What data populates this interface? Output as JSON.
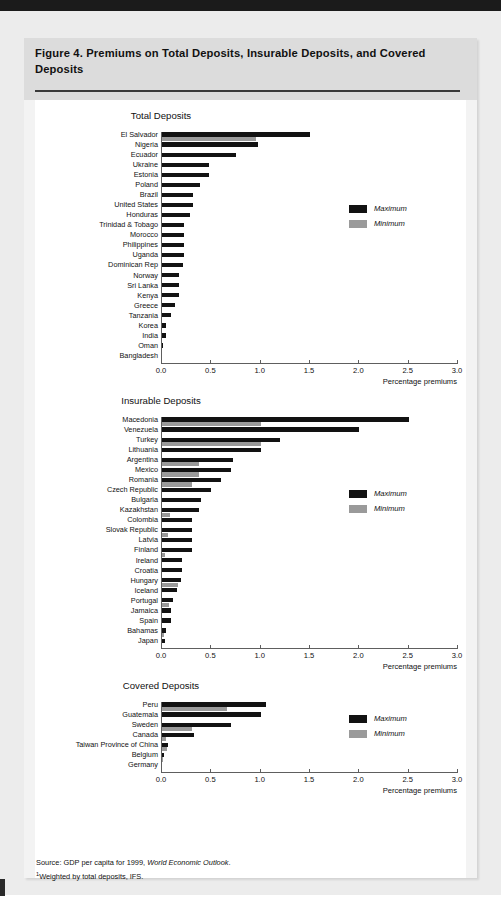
{
  "figure": {
    "title": "Figure 4.  Premiums on Total Deposits, Insurable Deposits, and Covered Deposits",
    "source_line1_prefix": "Source:  GDP per capita for 1999, ",
    "source_line1_italic": "World Economic Outlook",
    "source_line1_suffix": ".",
    "source_line2_marker": "1",
    "source_line2": "Weighted by total deposits, IFS."
  },
  "legend": {
    "maximum": "Maximum",
    "minimum": "Minimum"
  },
  "axis": {
    "xlabel": "Percentage premiums",
    "ticks": [
      "0.0",
      "0.5",
      "1.0",
      "1.5",
      "2.0",
      "2.5",
      "3.0"
    ]
  },
  "colors": {
    "maximum": "#121212",
    "minimum": "#9a9a9a",
    "panel": "#f3f3f3",
    "header": "#dcdcdc",
    "page": "#ececec",
    "axis": "#5e5e5e"
  },
  "chart_data": [
    {
      "type": "bar",
      "orientation": "horizontal",
      "title": "Total Deposits",
      "xlabel": "Percentage premiums",
      "ylabel": "",
      "xlim": [
        0.0,
        3.0
      ],
      "xticks": [
        0.0,
        0.5,
        1.0,
        1.5,
        2.0,
        2.5,
        3.0
      ],
      "grid": false,
      "legend_position": "right",
      "categories": [
        "El Salvador",
        "Nigeria",
        "Ecuador",
        "Ukraine",
        "Estonia",
        "Poland",
        "Brazil",
        "United States",
        "Honduras",
        "Trinidad & Tobago",
        "Morocco",
        "Philippines",
        "Uganda",
        "Dominican Rep",
        "Norway",
        "Sri Lanka",
        "Kenya",
        "Greece",
        "Tanzania",
        "Korea",
        "India",
        "Oman",
        "Bangladesh"
      ],
      "series": [
        {
          "name": "Maximum",
          "values": [
            1.5,
            0.97,
            0.75,
            0.48,
            0.48,
            0.39,
            0.31,
            0.31,
            0.28,
            0.22,
            0.22,
            0.22,
            0.22,
            0.21,
            0.17,
            0.17,
            0.17,
            0.13,
            0.09,
            0.04,
            0.04,
            0.01,
            0.0
          ]
        },
        {
          "name": "Minimum",
          "values": [
            0.95,
            0.0,
            0.0,
            0.0,
            0.0,
            0.0,
            0.0,
            0.0,
            0.0,
            0.0,
            0.0,
            0.0,
            0.0,
            0.0,
            0.0,
            0.0,
            0.0,
            0.0,
            0.0,
            0.0,
            0.0,
            0.0,
            0.0
          ]
        }
      ]
    },
    {
      "type": "bar",
      "orientation": "horizontal",
      "title": "Insurable Deposits",
      "xlabel": "Percentage premiums",
      "ylabel": "",
      "xlim": [
        0.0,
        3.0
      ],
      "xticks": [
        0.0,
        0.5,
        1.0,
        1.5,
        2.0,
        2.5,
        3.0
      ],
      "grid": false,
      "legend_position": "right",
      "categories": [
        "Macedonia",
        "Venezuela",
        "Turkey",
        "Lithuania",
        "Argentina",
        "Mexico",
        "Romania",
        "Czech Republic",
        "Bulgaria",
        "Kazakhstan",
        "Colombia",
        "Slovak Republic",
        "Latvia",
        "Finland",
        "Ireland",
        "Croatia",
        "Hungary",
        "Iceland",
        "Portugal",
        "Jamaica",
        "Spain",
        "Bahamas",
        "Japan"
      ],
      "series": [
        {
          "name": "Maximum",
          "values": [
            2.5,
            2.0,
            1.2,
            1.0,
            0.72,
            0.7,
            0.6,
            0.5,
            0.4,
            0.38,
            0.3,
            0.3,
            0.3,
            0.3,
            0.2,
            0.2,
            0.19,
            0.15,
            0.11,
            0.09,
            0.09,
            0.04,
            0.03
          ]
        },
        {
          "name": "Minimum",
          "values": [
            1.0,
            0.0,
            1.0,
            0.0,
            0.38,
            0.38,
            0.3,
            0.0,
            0.0,
            0.08,
            0.0,
            0.06,
            0.0,
            0.03,
            0.0,
            0.0,
            0.16,
            0.0,
            0.07,
            0.0,
            0.0,
            0.02,
            0.0
          ]
        }
      ]
    },
    {
      "type": "bar",
      "orientation": "horizontal",
      "title": "Covered Deposits",
      "xlabel": "Percentage premiums",
      "ylabel": "",
      "xlim": [
        0.0,
        3.0
      ],
      "xticks": [
        0.0,
        0.5,
        1.0,
        1.5,
        2.0,
        2.5,
        3.0
      ],
      "grid": false,
      "legend_position": "right",
      "categories": [
        "Peru",
        "Guatemala",
        "Sweden",
        "Canada",
        "Taiwan Province of China",
        "Belgium",
        "Germany"
      ],
      "series": [
        {
          "name": "Maximum",
          "values": [
            1.05,
            1.0,
            0.7,
            0.32,
            0.06,
            0.02,
            0.0
          ]
        },
        {
          "name": "Minimum",
          "values": [
            0.66,
            0.0,
            0.3,
            0.04,
            0.05,
            0.01,
            0.0
          ]
        }
      ]
    }
  ]
}
